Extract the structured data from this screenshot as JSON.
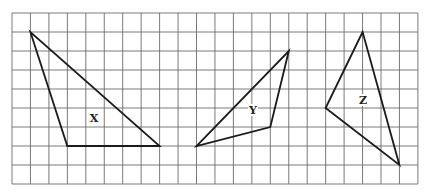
{
  "grid": {
    "left": 12,
    "top": 13,
    "columns": 22,
    "rows": 9,
    "cell_width": 18.45,
    "cell_height": 19,
    "line_color": "#6b6b6b"
  },
  "shapes": [
    {
      "label": "X",
      "vertices_grid": [
        [
          1,
          1
        ],
        [
          3,
          7
        ],
        [
          8,
          7
        ]
      ],
      "label_pos": [
        94,
        118
      ]
    },
    {
      "label": "Y",
      "vertices_grid": [
        [
          15,
          2
        ],
        [
          14,
          6
        ],
        [
          10,
          7
        ]
      ],
      "label_pos": [
        253,
        110
      ]
    },
    {
      "label": "Z",
      "vertices_grid": [
        [
          19,
          1
        ],
        [
          17,
          5
        ],
        [
          21,
          8
        ]
      ],
      "label_pos": [
        363,
        100
      ]
    }
  ],
  "stroke_color": "#1a1a1a"
}
